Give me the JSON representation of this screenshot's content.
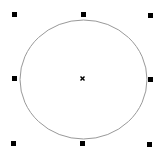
{
  "canvas": {
    "width": 164,
    "height": 161,
    "background": "#ffffff"
  },
  "shape": {
    "type": "ellipse",
    "cx": 83.5,
    "cy": 79.5,
    "rx": 63.5,
    "ry": 59.5,
    "stroke": "#999999",
    "fill": "none"
  },
  "center_marker": {
    "glyph": "×",
    "x": 82.5,
    "y": 78.5,
    "color": "#000000"
  },
  "handles": [
    {
      "id": "top-left",
      "x": 12,
      "y": 12
    },
    {
      "id": "top-center",
      "x": 81,
      "y": 12
    },
    {
      "id": "top-right",
      "x": 148,
      "y": 13
    },
    {
      "id": "middle-left",
      "x": 12,
      "y": 76
    },
    {
      "id": "middle-right",
      "x": 148,
      "y": 77
    },
    {
      "id": "bottom-left",
      "x": 11,
      "y": 141
    },
    {
      "id": "bottom-center",
      "x": 80,
      "y": 141
    },
    {
      "id": "bottom-right",
      "x": 147,
      "y": 142
    }
  ]
}
